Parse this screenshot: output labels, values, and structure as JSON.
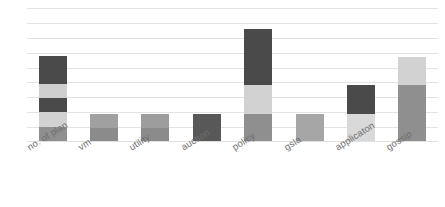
{
  "chart_data": {
    "type": "bar",
    "subtype": "stacked-bar",
    "title": "",
    "subtitle": "",
    "xlabel": "",
    "ylabel": "",
    "grid": true,
    "gridline_count": 9,
    "legend": false,
    "legend_position": "none",
    "axis_tick_labels": [],
    "ylim": [
      0,
      9
    ],
    "categories": [
      "no. of plan",
      "vm",
      "utility",
      "auction",
      "policy",
      "gsla",
      "applicaton",
      "gossip"
    ],
    "series": [
      {
        "name": "segment-1",
        "color": "#8f8f8f",
        "values": [
          1.0,
          1.9,
          1.9,
          0.0,
          1.9,
          1.9,
          0.0,
          3.8
        ]
      },
      {
        "name": "segment-2",
        "color": "#d2d2d2",
        "values": [
          1.0,
          0.0,
          0.0,
          0.0,
          1.9,
          0.0,
          1.9,
          1.9
        ]
      },
      {
        "name": "segment-3",
        "color": "#4a4a4a",
        "values": [
          0.95,
          0.0,
          0.0,
          1.9,
          3.8,
          0.0,
          1.9,
          0.0
        ]
      },
      {
        "name": "segment-4",
        "color": "#cfcfcf",
        "values": [
          0.95,
          0.0,
          0.0,
          0.0,
          0.0,
          0.0,
          0.0,
          0.0
        ]
      },
      {
        "name": "segment-5",
        "color": "#4a4a4a",
        "values": [
          1.9,
          0.0,
          0.0,
          0.0,
          0.0,
          0.0,
          0.0,
          0.0
        ]
      }
    ],
    "stack_totals": [
      5.8,
      1.9,
      1.9,
      1.9,
      7.6,
      1.9,
      3.8,
      5.7
    ],
    "bars": [
      {
        "category": "no. of plan",
        "total": 5.8,
        "segments": [
          {
            "color": "#8f8f8f",
            "value": 1.0
          },
          {
            "color": "#d2d2d2",
            "value": 1.0
          },
          {
            "color": "#4a4a4a",
            "value": 0.95
          },
          {
            "color": "#cfcfcf",
            "value": 0.95
          },
          {
            "color": "#4a4a4a",
            "value": 1.9
          }
        ]
      },
      {
        "category": "vm",
        "total": 1.9,
        "segments": [
          {
            "color": "#8b8b8b",
            "value": 0.95
          },
          {
            "color": "#a0a0a0",
            "value": 0.95
          }
        ]
      },
      {
        "category": "utility",
        "total": 1.9,
        "segments": [
          {
            "color": "#8b8b8b",
            "value": 0.95
          },
          {
            "color": "#9d9d9d",
            "value": 0.95
          }
        ]
      },
      {
        "category": "auction",
        "total": 1.9,
        "segments": [
          {
            "color": "#585858",
            "value": 1.9
          }
        ]
      },
      {
        "category": "policy",
        "total": 7.6,
        "segments": [
          {
            "color": "#8f8f8f",
            "value": 1.9
          },
          {
            "color": "#d2d2d2",
            "value": 1.9
          },
          {
            "color": "#4a4a4a",
            "value": 3.8
          }
        ]
      },
      {
        "category": "gsla",
        "total": 1.9,
        "segments": [
          {
            "color": "#a6a6a6",
            "value": 1.9
          }
        ]
      },
      {
        "category": "applicaton",
        "total": 3.8,
        "segments": [
          {
            "color": "#d9d9d9",
            "value": 1.9
          },
          {
            "color": "#4a4a4a",
            "value": 1.9
          }
        ]
      },
      {
        "category": "gossip",
        "total": 5.7,
        "segments": [
          {
            "color": "#8f8f8f",
            "value": 3.8
          },
          {
            "color": "#d2d2d2",
            "value": 1.9
          }
        ]
      }
    ]
  },
  "style": {
    "background": "#ffffff",
    "gridline_color": "#e3e3e3",
    "label_color": "#6e6e6e",
    "label_rotation_deg": -32
  }
}
